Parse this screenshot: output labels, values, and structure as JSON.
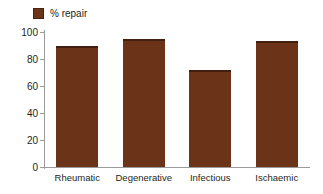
{
  "legend": {
    "swatch_icon": "legend-swatch-icon",
    "label": "% repair",
    "color": "#6B3318"
  },
  "chart_data": {
    "type": "bar",
    "title": "",
    "xlabel": "",
    "ylabel": "",
    "categories": [
      "Rheumatic",
      "Degenerative",
      "Infectious",
      "Ischaemic"
    ],
    "values": [
      90,
      95,
      72,
      93
    ],
    "series": [
      {
        "name": "% repair",
        "values": [
          90,
          95,
          72,
          93
        ],
        "color": "#6B3318"
      }
    ],
    "ylim": [
      0,
      100
    ],
    "yticks": [
      0,
      20,
      40,
      60,
      80,
      100
    ],
    "ytick_labels": [
      "0",
      "20",
      "40",
      "60",
      "80",
      "100"
    ],
    "grid": false,
    "legend_position": "top-left",
    "bar_color": "#6B3318",
    "axis_color": "#9b9b9b",
    "text_color": "#231f20"
  }
}
